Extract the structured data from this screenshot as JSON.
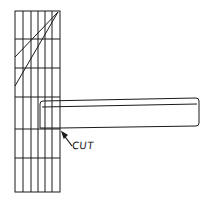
{
  "diagram": {
    "annotation": {
      "label": "CUT"
    },
    "colors": {
      "ink": "#1a1a1a",
      "background": "#ffffff"
    }
  }
}
